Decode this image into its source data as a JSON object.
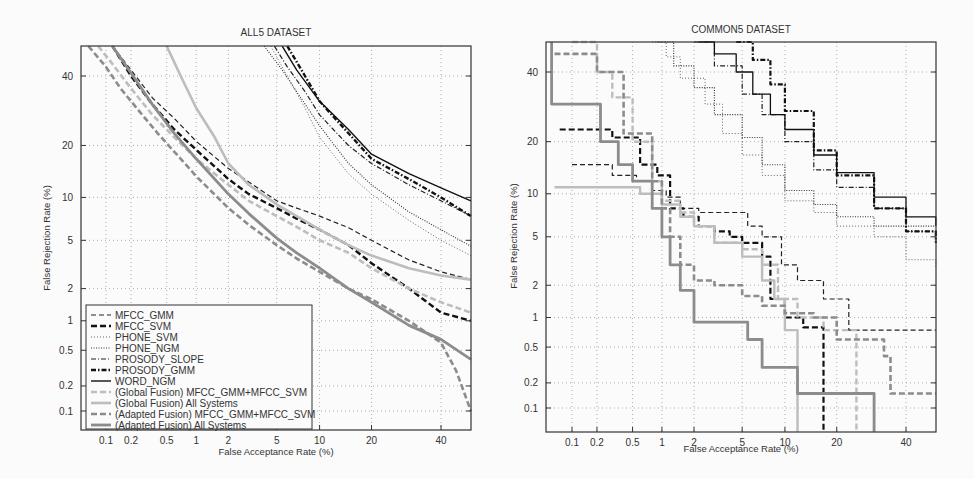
{
  "chart_data": [
    {
      "type": "line",
      "title": "ALL5 DATASET",
      "xlabel": "False Acceptance Rate (%)",
      "ylabel": "False Rejection Rate (%)",
      "xscale": "normal-deviate",
      "yscale": "normal-deviate",
      "xticks": [
        0.1,
        0.2,
        0.5,
        1,
        2,
        5,
        10,
        20,
        40
      ],
      "yticks": [
        0.1,
        0.2,
        0.5,
        1,
        2,
        5,
        10,
        20,
        40
      ],
      "xlim": [
        0.05,
        50
      ],
      "ylim": [
        0.05,
        50
      ],
      "grid": true,
      "legend_position": "lower left",
      "series": [
        {
          "name": "MFCC_GMM",
          "style": "dash",
          "color": "#222222",
          "width": 1.2,
          "x": [
            0.12,
            0.2,
            0.35,
            0.6,
            1,
            2,
            3,
            5,
            7,
            10,
            15,
            20,
            30,
            40,
            50
          ],
          "y": [
            50,
            42,
            33,
            27,
            21,
            15,
            12.5,
            9.5,
            8.5,
            7.5,
            6.2,
            5,
            3.5,
            2.8,
            2.4
          ]
        },
        {
          "name": "MFCC_SVM",
          "style": "heavydash",
          "color": "#111111",
          "width": 2.4,
          "x": [
            0.12,
            0.2,
            0.35,
            0.6,
            1,
            2,
            3,
            5,
            7,
            10,
            15,
            20,
            30,
            40,
            50
          ],
          "y": [
            50,
            40,
            31,
            24,
            19,
            13,
            10.5,
            8.5,
            7.2,
            6,
            4.6,
            3.3,
            2,
            1.2,
            1
          ]
        },
        {
          "name": "PHONE_SVM",
          "style": "dot",
          "color": "#555555",
          "width": 0.9,
          "x": [
            4.5,
            6,
            8,
            10,
            15,
            20,
            30,
            40,
            50
          ],
          "y": [
            50,
            40,
            30,
            22,
            14,
            10.5,
            7,
            5,
            3.8
          ]
        },
        {
          "name": "PHONE_NGM",
          "style": "dotdense",
          "color": "#333333",
          "width": 1.1,
          "x": [
            4,
            5.5,
            7,
            10,
            15,
            20,
            30,
            40,
            50
          ],
          "y": [
            50,
            42,
            35,
            25,
            16,
            12,
            8,
            6,
            4.5
          ]
        },
        {
          "name": "PROSODY_SLOPE",
          "style": "dashdot",
          "color": "#222222",
          "width": 1.2,
          "x": [
            4.8,
            6,
            8,
            10,
            15,
            20,
            30,
            40,
            50
          ],
          "y": [
            50,
            43,
            35,
            28,
            20,
            16,
            12,
            9.5,
            7.5
          ]
        },
        {
          "name": "PROSODY_GMM",
          "style": "heavydashdot",
          "color": "#111111",
          "width": 2.4,
          "x": [
            6,
            8,
            10,
            15,
            20,
            30,
            40,
            50
          ],
          "y": [
            50,
            40,
            32,
            23,
            17,
            13,
            10,
            7.5
          ]
        },
        {
          "name": "WORD_NGM",
          "style": "solid",
          "color": "#111111",
          "width": 1.4,
          "x": [
            5.5,
            7,
            10,
            15,
            20,
            30,
            40,
            50
          ],
          "y": [
            50,
            42,
            32,
            24,
            18,
            14,
            11.5,
            9.5
          ]
        },
        {
          "name": "(Global Fusion) MFCC_GMM+MFCC_SVM",
          "style": "heavydash",
          "color": "#bdbdbd",
          "width": 2.6,
          "x": [
            0.08,
            0.12,
            0.2,
            0.35,
            0.6,
            1,
            2,
            3,
            5,
            7,
            10,
            15,
            20,
            30,
            40,
            50
          ],
          "y": [
            50,
            44,
            36,
            28,
            22,
            17,
            12,
            9.5,
            7.5,
            6.3,
            5,
            4,
            3,
            2,
            1.5,
            1.2
          ]
        },
        {
          "name": "(Global Fusion) All Systems",
          "style": "solid",
          "color": "#bdbdbd",
          "width": 2.6,
          "x": [
            0.5,
            0.7,
            1,
            1.5,
            2,
            3,
            5,
            7,
            10,
            15,
            20,
            30,
            40,
            50
          ],
          "y": [
            50,
            40,
            30,
            22,
            16,
            12,
            9,
            7.5,
            6,
            4.6,
            3.8,
            3,
            2.6,
            2.4
          ]
        },
        {
          "name": "(Adapted Fusion) MFCC_GMM+MFCC_SVM",
          "style": "heavydash",
          "color": "#8c8c8c",
          "width": 2.6,
          "x": [
            0.06,
            0.1,
            0.15,
            0.25,
            0.4,
            0.7,
            1,
            2,
            3,
            5,
            7,
            10,
            15,
            20,
            30,
            40,
            45,
            50
          ],
          "y": [
            50,
            43,
            36,
            29,
            23,
            17,
            13.5,
            8.5,
            6.5,
            4.6,
            3.6,
            2.8,
            2,
            1.6,
            1,
            0.6,
            0.3,
            0.1
          ]
        },
        {
          "name": "(Adapted Fusion) All Systems",
          "style": "solid",
          "color": "#8c8c8c",
          "width": 2.8,
          "x": [
            0.12,
            0.2,
            0.35,
            0.6,
            1,
            2,
            3,
            5,
            7,
            10,
            15,
            20,
            30,
            40,
            50
          ],
          "y": [
            50,
            41,
            31,
            23,
            17,
            10.5,
            7.8,
            5.2,
            4,
            3,
            2,
            1.5,
            0.9,
            0.65,
            0.4
          ]
        }
      ]
    },
    {
      "type": "line",
      "title": "COMMON5 DATASET",
      "xlabel": "False Acceptance Rate (%)",
      "ylabel": "False Rejection Rate (%)",
      "xscale": "normal-deviate",
      "yscale": "normal-deviate",
      "xticks": [
        0.1,
        0.2,
        0.5,
        1,
        2,
        5,
        10,
        20,
        40
      ],
      "yticks": [
        0.1,
        0.2,
        0.5,
        1,
        2,
        5,
        10,
        20,
        40
      ],
      "xlim": [
        0.05,
        50
      ],
      "ylim": [
        0.05,
        50
      ],
      "grid": true,
      "series": [
        {
          "name": "MFCC_GMM",
          "style": "dash",
          "color": "#222222",
          "width": 1.2,
          "step": true,
          "x": [
            0.1,
            0.22,
            0.3,
            0.55,
            0.8,
            1.1,
            1.5,
            2.2,
            4,
            5.5,
            7,
            9.5,
            12,
            17,
            23,
            50
          ],
          "y": [
            15,
            15,
            13,
            12,
            10.5,
            9.5,
            8,
            7.5,
            7.5,
            6,
            5,
            3,
            2.2,
            1.5,
            0.75,
            0.75
          ]
        },
        {
          "name": "MFCC_SVM",
          "style": "heavydash",
          "color": "#111111",
          "width": 2.2,
          "step": true,
          "x": [
            0.07,
            0.22,
            0.3,
            0.6,
            0.9,
            1.2,
            1.6,
            2.2,
            3,
            4,
            5,
            7,
            8,
            10,
            13,
            17,
            17
          ],
          "y": [
            23,
            23,
            21,
            15,
            13,
            8,
            7,
            6,
            5.5,
            5,
            4.5,
            3.5,
            1.5,
            1.0,
            0.8,
            0.8,
            0.05
          ]
        },
        {
          "name": "PHONE_SVM",
          "style": "dot",
          "color": "#555555",
          "width": 0.9,
          "step": true,
          "x": [
            0.8,
            1.1,
            1.5,
            2.5,
            3.5,
            5,
            7,
            10,
            15,
            20,
            30,
            40,
            50
          ],
          "y": [
            50,
            45,
            38,
            30,
            22,
            17,
            13,
            9,
            7.5,
            6,
            5,
            3.3,
            2.8
          ]
        },
        {
          "name": "PHONE_NGM",
          "style": "dotdense",
          "color": "#333333",
          "width": 1.1,
          "step": true,
          "x": [
            0.9,
            1.3,
            2,
            3,
            5,
            7,
            10,
            15,
            20,
            30,
            40,
            50
          ],
          "y": [
            50,
            42,
            35,
            27,
            21,
            15,
            10.5,
            8.5,
            7,
            6,
            6,
            6
          ]
        },
        {
          "name": "PROSODY_SLOPE",
          "style": "dashdot",
          "color": "#222222",
          "width": 1.2,
          "step": true,
          "x": [
            2,
            3,
            5,
            7,
            10,
            15,
            20,
            30,
            40,
            50
          ],
          "y": [
            50,
            42,
            33,
            27,
            20,
            14,
            11,
            8,
            5.5,
            4.5
          ]
        },
        {
          "name": "PROSODY_GMM",
          "style": "heavydashdot",
          "color": "#111111",
          "width": 2.2,
          "step": true,
          "x": [
            4.5,
            6,
            8,
            10,
            15,
            20,
            30,
            40,
            50
          ],
          "y": [
            50,
            44,
            36,
            28,
            18,
            13,
            8,
            5.5,
            4.5
          ]
        },
        {
          "name": "WORD_NGM",
          "style": "solid",
          "color": "#111111",
          "width": 1.3,
          "step": true,
          "x": [
            2.2,
            3,
            4.5,
            6,
            8,
            10,
            15,
            20,
            30,
            40,
            50
          ],
          "y": [
            50,
            46,
            40,
            33,
            27,
            23,
            17,
            13.5,
            9.5,
            7,
            6
          ]
        },
        {
          "name": "(Global Fusion) MFCC_GMM+MFCC_SVM",
          "style": "heavydash",
          "color": "#bdbdbd",
          "width": 2.4,
          "step": true,
          "x": [
            0.1,
            0.2,
            0.3,
            0.5,
            0.8,
            1,
            1.5,
            2,
            3,
            5,
            7,
            9,
            12,
            17,
            25,
            25
          ],
          "y": [
            50,
            40,
            32,
            20,
            12,
            9,
            7.5,
            6,
            4.5,
            4,
            3,
            1.5,
            1,
            0.75,
            0.5,
            0.05
          ]
        },
        {
          "name": "(Global Fusion) All Systems",
          "style": "solid",
          "color": "#bdbdbd",
          "width": 2.4,
          "step": true,
          "x": [
            0.06,
            0.35,
            0.6,
            1,
            1.5,
            2,
            3,
            5,
            7,
            8.5,
            10,
            12,
            12
          ],
          "y": [
            11,
            11,
            10,
            8.5,
            7,
            6,
            4.5,
            3.5,
            2.2,
            1.5,
            0.75,
            0.75,
            0.05
          ]
        },
        {
          "name": "(Adapted Fusion) MFCC_GMM+MFCC_SVM",
          "style": "heavydash",
          "color": "#8c8c8c",
          "width": 2.6,
          "step": true,
          "x": [
            0.06,
            0.12,
            0.2,
            0.4,
            0.8,
            1,
            1.2,
            1.5,
            2,
            3,
            5,
            7,
            10,
            15,
            20,
            30,
            33,
            35,
            50
          ],
          "y": [
            46,
            46,
            40,
            22,
            12,
            8,
            5,
            3,
            2.2,
            2,
            1.6,
            1.3,
            1.1,
            1.0,
            0.6,
            0.6,
            0.4,
            0.15,
            0.15
          ]
        },
        {
          "name": "(Adapted Fusion) All Systems",
          "style": "solid",
          "color": "#8c8c8c",
          "width": 2.8,
          "step": true,
          "x": [
            0.055,
            0.055,
            0.13,
            0.22,
            0.35,
            0.5,
            0.8,
            1,
            1.2,
            1.5,
            2,
            4.5,
            5.5,
            7,
            12,
            30,
            30
          ],
          "y": [
            50,
            30,
            30,
            20,
            15,
            12,
            8,
            5,
            3,
            1.8,
            0.9,
            0.9,
            0.6,
            0.3,
            0.15,
            0.15,
            0.05
          ]
        }
      ]
    }
  ],
  "left_chart": {
    "title": "ALL5 DATASET",
    "xlabel": "False Acceptance Rate (%)",
    "ylabel": "False Rejection Rate (%)",
    "tick_labels": [
      "0.1",
      "0.2",
      "0.5",
      "1",
      "2",
      "5",
      "10",
      "20",
      "40"
    ],
    "legend": [
      "MFCC_GMM",
      "MFCC_SVM",
      "PHONE_SVM",
      "PHONE_NGM",
      "PROSODY_SLOPE",
      "PROSODY_GMM",
      "WORD_NGM",
      "(Global Fusion) MFCC_GMM+MFCC_SVM",
      "(Global Fusion) All Systems",
      "(Adapted Fusion) MFCC_GMM+MFCC_SVM",
      "(Adapted Fusion) All Systems"
    ]
  },
  "right_chart": {
    "title": "COMMON5 DATASET",
    "xlabel": "False Acceptance Rate (%)",
    "ylabel": "False Rejection Rate (%)",
    "tick_labels": [
      "0.1",
      "0.2",
      "0.5",
      "1",
      "2",
      "5",
      "10",
      "20",
      "40"
    ]
  }
}
